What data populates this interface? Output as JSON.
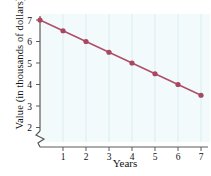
{
  "chart_data": {
    "type": "line",
    "title": "",
    "xlabel": "Years",
    "ylabel": "Value (in thousands of dollars)",
    "x": [
      0,
      1,
      2,
      3,
      4,
      5,
      6,
      7
    ],
    "values": [
      7,
      6.5,
      6,
      5.5,
      5,
      4.5,
      4,
      3.5
    ],
    "series": [
      {
        "name": "Value",
        "values": [
          7,
          6.5,
          6,
          5.5,
          5,
          4.5,
          4,
          3.5
        ]
      }
    ],
    "xticks": [
      1,
      2,
      3,
      4,
      5,
      6,
      7
    ],
    "xtick_labels": [
      "1",
      "2",
      "3",
      "4",
      "5",
      "6",
      "7"
    ],
    "yticks": [
      2,
      3,
      4,
      5,
      6,
      7
    ],
    "ytick_labels": [
      "2",
      "3",
      "4",
      "5",
      "6",
      "7"
    ],
    "xlim": [
      0,
      7
    ],
    "ylim": [
      1.55,
      7
    ],
    "grid": "vertical",
    "axis_break": true,
    "legend": "none",
    "line_color": "#b05068",
    "marker_color": "#a8475f",
    "plot_background": "#f2fafb",
    "axis_color": "#555555",
    "gridline_color": "#dceef2"
  },
  "axis": {
    "y_tick_2": "2",
    "y_tick_3": "3",
    "y_tick_4": "4",
    "y_tick_5": "5",
    "y_tick_6": "6",
    "y_tick_7": "7",
    "x_tick_1": "1",
    "x_tick_2": "2",
    "x_tick_3": "3",
    "x_tick_4": "4",
    "x_tick_5": "5",
    "x_tick_6": "6",
    "x_tick_7": "7"
  }
}
